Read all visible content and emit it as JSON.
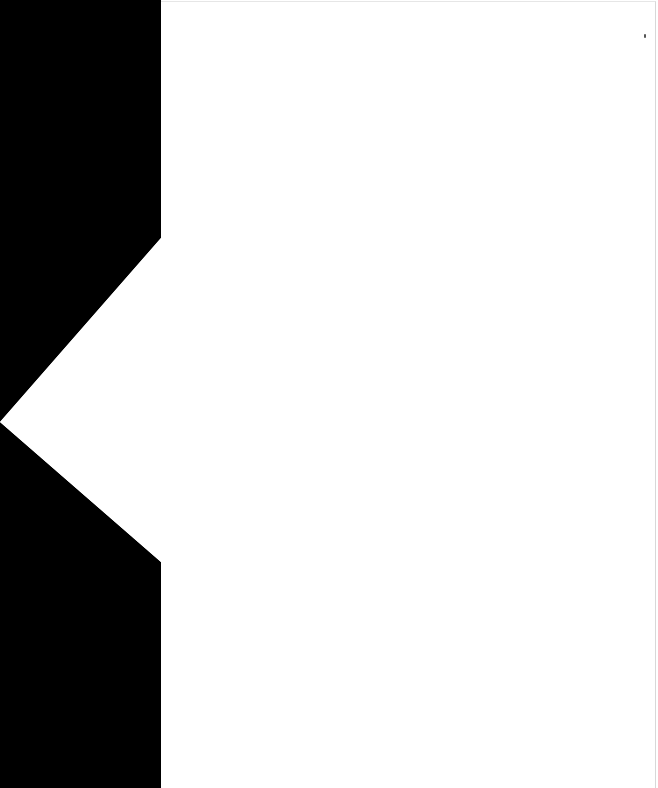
{
  "canvas": {
    "background": "#ffffff",
    "shape_color": "#000000"
  },
  "shape": {
    "description": "black panel with white left-pointing triangular notch",
    "notch_tip": [
      0,
      422
    ],
    "notch_top": [
      161,
      238
    ],
    "notch_bottom": [
      161,
      562
    ]
  },
  "page": {
    "text": ""
  }
}
